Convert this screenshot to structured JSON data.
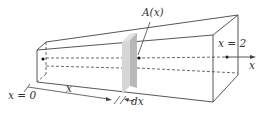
{
  "diagram": {
    "labels": {
      "area": "A(x)",
      "x_start": "x = 0",
      "x_end": "x = 2",
      "axis": "x",
      "distance": "x",
      "thickness": "dx"
    },
    "colors": {
      "line": "#444444",
      "slab_front": "#bdbdbd",
      "slab_side": "#d9d9d9",
      "background": "#ffffff"
    }
  }
}
